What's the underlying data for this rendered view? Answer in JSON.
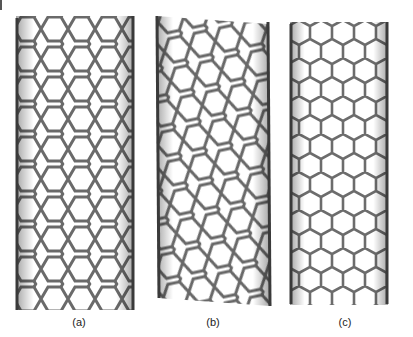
{
  "figure": {
    "panels": [
      {
        "id": "a",
        "label": "(a)",
        "type": "armchair"
      },
      {
        "id": "b",
        "label": "(b)",
        "type": "chiral"
      },
      {
        "id": "c",
        "label": "(c)",
        "type": "zigzag"
      }
    ]
  },
  "colors": {
    "bond": "#6e6e6e",
    "bond_dark": "#3a3a3a",
    "background": "#ffffff"
  }
}
